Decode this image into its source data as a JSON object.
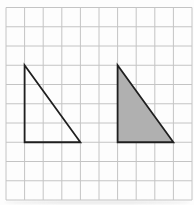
{
  "figure": {
    "width": 194,
    "height": 205,
    "background": "#fdfdfd",
    "grid": {
      "x0": 6,
      "y0": 7.5,
      "cols": 10,
      "rows": 10,
      "cell_w": 18.6,
      "cell_h": 19.25,
      "line_color": "#c4c4c4",
      "line_width": 1
    },
    "shapes": [
      {
        "name": "outline-triangle",
        "type": "polygon",
        "points_grid": [
          [
            1,
            3
          ],
          [
            1,
            7
          ],
          [
            4,
            7
          ]
        ],
        "fill": "none",
        "stroke": "#1f1f1f",
        "stroke_width": 1.8
      },
      {
        "name": "shaded-triangle",
        "type": "polygon",
        "points_grid": [
          [
            6,
            3
          ],
          [
            6,
            7
          ],
          [
            9,
            7
          ]
        ],
        "fill": "#b0b0b0",
        "stroke": "#1f1f1f",
        "stroke_width": 1.8
      }
    ]
  }
}
